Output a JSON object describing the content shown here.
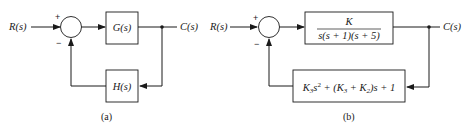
{
  "diagram_a": {
    "input_label": "R(s)",
    "output_label": "C(s)",
    "summing_junction": {
      "plus_sign": "+",
      "minus_sign": "−"
    },
    "forward_block": "G(s)",
    "feedback_block": "H(s)",
    "caption": "(a)"
  },
  "diagram_b": {
    "input_label": "R(s)",
    "output_label": "C(s)",
    "summing_junction": {
      "plus_sign": "+",
      "minus_sign": "−"
    },
    "forward_block": {
      "numerator": "K",
      "denominator": "s(s + 1)(s + 5)"
    },
    "feedback_block": {
      "term1_coef": "K",
      "term1_coef_sub": "3",
      "term1_var": "s",
      "term1_exp": "2",
      "middle": " + (K",
      "middle_sub1": "3",
      "middle_plus": " + K",
      "middle_sub2": "2",
      "tail": ")s + 1",
      "full_text": "K3s^2 + (K3 + K2)s + 1"
    },
    "caption": "(b)"
  }
}
